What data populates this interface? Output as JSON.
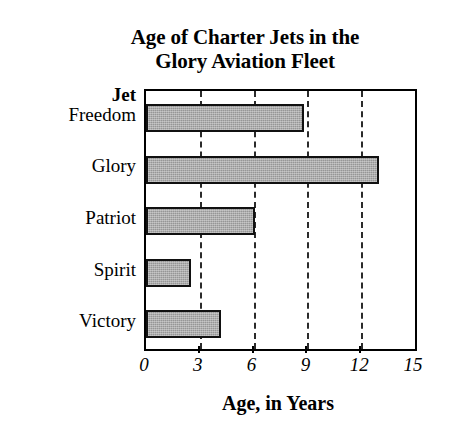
{
  "chart_data": {
    "type": "bar",
    "orientation": "horizontal",
    "title": "Age of Charter Jets in the Glory Aviation Fleet",
    "title_lines": [
      "Age of Charter Jets in the",
      "Glory Aviation Fleet"
    ],
    "categories": [
      "Freedom",
      "Glory",
      "Patriot",
      "Spirit",
      "Victory"
    ],
    "values": [
      8.8,
      13.0,
      6.1,
      2.5,
      4.2
    ],
    "category_axis_label": "Jet",
    "xlabel": "Age, in Years",
    "ylabel": "Jet",
    "xlim": [
      0,
      15
    ],
    "xticks": [
      0,
      3,
      6,
      9,
      12,
      15
    ],
    "xtick_labels": [
      "0",
      "3",
      "6",
      "9",
      "12",
      "15"
    ],
    "grid": true,
    "grid_axis": "x",
    "grid_style": "dashed",
    "legend": false,
    "bar_color": "#969696",
    "bar_edge_color": "#111111",
    "frame_color": "#000000",
    "background_color": "#ffffff"
  },
  "axis_title": {
    "category": "Jet",
    "value": "Age, in Years"
  }
}
